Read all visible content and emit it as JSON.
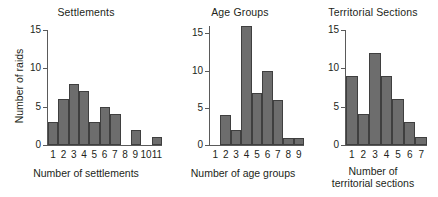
{
  "figure": {
    "background": "#ffffff",
    "bar_fill": "#6d6d6d",
    "bar_stroke": "#3f3f3f",
    "axis_color": "#5a5a5a",
    "text_color": "#231f20"
  },
  "chart_data": [
    {
      "type": "bar",
      "title": "Settlements",
      "xlabel": "Number of settlements",
      "ylabel": "Number of raids",
      "categories": [
        "1",
        "2",
        "3",
        "4",
        "5",
        "6",
        "7",
        "8",
        "9",
        "10",
        "11"
      ],
      "values": [
        3,
        6,
        8,
        7,
        3,
        5,
        4,
        0,
        2,
        0,
        1
      ],
      "ylim": [
        0,
        15
      ],
      "yticks": [
        0,
        5,
        10,
        15
      ],
      "ytick_labels": [
        "0",
        "5",
        "10",
        "15"
      ],
      "grid": false,
      "legend": "none"
    },
    {
      "type": "bar",
      "title": "Age Groups",
      "xlabel": "Number of age groups",
      "ylabel": "",
      "categories": [
        "1",
        "2",
        "3",
        "4",
        "5",
        "6",
        "7",
        "8",
        "9"
      ],
      "values": [
        0,
        4,
        2,
        16,
        7,
        10,
        6,
        1,
        1
      ],
      "ylim": [
        0,
        16
      ],
      "yticks": [
        0,
        5,
        10,
        15
      ],
      "ytick_labels": [
        "0",
        "5",
        "10",
        "15"
      ],
      "grid": false,
      "legend": "none"
    },
    {
      "type": "bar",
      "title": "Territorial Sections",
      "xlabel": "Number of territorial sections",
      "xlabel_line1": "Number of",
      "xlabel_line2": "territorial sections",
      "ylabel": "",
      "categories": [
        "1",
        "2",
        "3",
        "4",
        "5",
        "6",
        "7"
      ],
      "values": [
        9,
        4,
        12,
        9,
        6,
        3,
        1
      ],
      "ylim": [
        0,
        15
      ],
      "yticks": [
        0,
        5,
        10,
        15
      ],
      "ytick_labels": [
        "0",
        "5",
        "10",
        "15"
      ],
      "grid": false,
      "legend": "none"
    }
  ]
}
